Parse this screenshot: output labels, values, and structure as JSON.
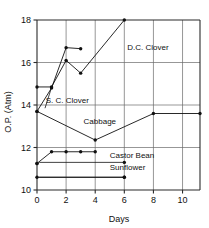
{
  "chart_data": {
    "type": "line",
    "title": "",
    "xlabel": "Days",
    "ylabel": "O.P. (Atm)",
    "xlim": [
      0,
      11.2
    ],
    "ylim": [
      10,
      18
    ],
    "xticks": [
      0,
      2,
      4,
      6,
      8,
      10
    ],
    "xticklabels": [
      "0",
      "2",
      "4",
      "6",
      "8",
      "10"
    ],
    "yticks": [
      10,
      12,
      14,
      16,
      18
    ],
    "yticklabels": [
      "10",
      "12",
      "14",
      "16",
      "18"
    ],
    "grid": true,
    "legend_position": "inline-annotations",
    "series": [
      {
        "name": "D.C. Clover",
        "label": "D.C. Clover",
        "x": [
          0,
          1,
          2,
          3,
          6
        ],
        "y": [
          14.85,
          14.85,
          16.1,
          15.5,
          18.0
        ]
      },
      {
        "name": "S. C. Clover",
        "label": "S. C. Clover",
        "x": [
          0,
          1,
          2,
          3
        ],
        "y": [
          13.7,
          14.8,
          16.7,
          16.65
        ]
      },
      {
        "name": "Cabbage",
        "label": "Cabbage",
        "x": [
          0,
          4,
          8,
          11.2
        ],
        "y": [
          13.7,
          12.35,
          13.6,
          13.6
        ]
      },
      {
        "name": "Castor Bean",
        "label": "Castor Bean",
        "x": [
          0,
          1,
          2,
          3,
          4
        ],
        "y": [
          11.25,
          11.8,
          11.8,
          11.8,
          11.8
        ]
      },
      {
        "name": "Sunflower",
        "label": "Sunflower",
        "x": [
          0,
          6
        ],
        "y": [
          10.6,
          10.6
        ]
      }
    ],
    "extra_points": [
      {
        "series": "Castor Bean",
        "x": 0,
        "y": 11.25
      },
      {
        "series": "Castor Bean",
        "x": 6,
        "y": 11.3
      },
      {
        "series": "Sunflower",
        "x": 6,
        "y": 10.6
      }
    ],
    "annotations": [
      {
        "text": "D.C. Clover",
        "x": 6.2,
        "y": 16.6
      },
      {
        "text": "S. C. Clover",
        "x": 0.6,
        "y": 14.1
      },
      {
        "text": "Cabbage",
        "x": 3.2,
        "y": 13.1
      },
      {
        "text": "Castor Bean",
        "x": 5.0,
        "y": 11.5
      },
      {
        "text": "Sunflower",
        "x": 5.0,
        "y": 10.95
      }
    ],
    "colors": {
      "line": "#111111",
      "marker": "#111111",
      "grid": "#6a6a6a",
      "frame": "#2b2b2b",
      "background": "#ffffff"
    }
  }
}
